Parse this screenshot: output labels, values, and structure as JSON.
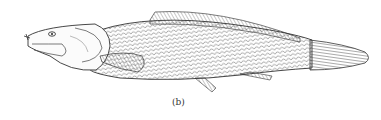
{
  "figure": {
    "caption": "(b)",
    "style": "pen-and-ink line drawing",
    "colors": {
      "ink": "#3a3a3a",
      "paper": "#ffffff"
    }
  }
}
